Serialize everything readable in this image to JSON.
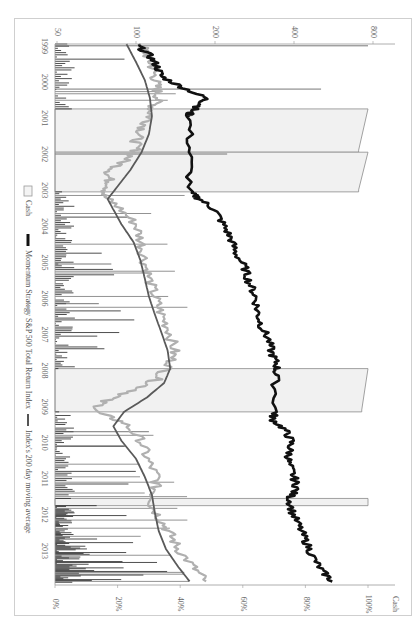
{
  "chart_data": {
    "type": "line",
    "orientation": "rotated-90-clockwise",
    "title": "",
    "xlabel": "",
    "ylabel_left": "",
    "ylabel_right": "Cash",
    "x_tick_labels": [
      "1999",
      "2000",
      "2001",
      "2002",
      "2003",
      "2004",
      "2005",
      "2006",
      "2007",
      "2008",
      "2009",
      "2010",
      "2011",
      "2012",
      "2013"
    ],
    "y_left_scale": "log",
    "y_left_ticks": [
      50,
      100,
      200,
      400,
      800
    ],
    "y_left_tick_labels": [
      "50",
      "100",
      "200",
      "400",
      "800"
    ],
    "y_right_ticks": [
      0,
      20,
      40,
      60,
      80,
      100
    ],
    "y_right_tick_labels": [
      "0%",
      "20%",
      "40%",
      "60%",
      "80%",
      "100%"
    ],
    "y_right_unit_label": "Cash",
    "legend": [
      {
        "name": "Cash",
        "style": "box-outline",
        "color": "#9a9a9a"
      },
      {
        "name": "Momentum Strategy",
        "style": "thick-line",
        "color": "#111111"
      },
      {
        "name": "S&P 500 Total Return Index",
        "style": "line",
        "color": "#b0b0b0"
      },
      {
        "name": "Index's 200 day moving average",
        "style": "line",
        "color": "#555555"
      }
    ],
    "legend_position": "left-side (rotated bottom)",
    "series": [
      {
        "name": "Momentum Strategy",
        "x": [
          1999.0,
          1999.3,
          1999.6,
          1999.9,
          2000.2,
          2000.5,
          2000.7,
          2000.9,
          2001.0,
          2002.0,
          2003.1,
          2003.3,
          2003.6,
          2004.0,
          2004.4,
          2004.8,
          2005.2,
          2005.6,
          2006.0,
          2006.4,
          2006.8,
          2007.2,
          2007.6,
          2007.9,
          2008.2,
          2009.2,
          2009.4,
          2009.7,
          2010.0,
          2010.3,
          2010.6,
          2011.0,
          2011.3,
          2011.6,
          2012.0,
          2012.4,
          2012.8,
          2013.2,
          2013.6,
          2013.9
        ],
        "values": [
          100,
          112,
          120,
          125,
          150,
          185,
          175,
          160,
          160,
          160,
          160,
          175,
          200,
          215,
          230,
          240,
          260,
          270,
          285,
          290,
          300,
          320,
          330,
          345,
          340,
          340,
          330,
          370,
          390,
          385,
          380,
          400,
          410,
          385,
          395,
          420,
          445,
          470,
          510,
          560
        ]
      },
      {
        "name": "S&P 500 Total Return Index",
        "x": [
          1999.0,
          1999.3,
          1999.6,
          1999.9,
          2000.2,
          2000.5,
          2000.8,
          2001.1,
          2001.4,
          2001.7,
          2002.0,
          2002.3,
          2002.6,
          2002.9,
          2003.2,
          2003.5,
          2004.0,
          2004.5,
          2005.0,
          2005.5,
          2006.0,
          2006.5,
          2007.0,
          2007.5,
          2007.9,
          2008.3,
          2008.6,
          2008.9,
          2009.2,
          2009.5,
          2010.0,
          2010.5,
          2011.0,
          2011.4,
          2011.8,
          2012.2,
          2012.6,
          2013.0,
          2013.5,
          2013.9
        ],
        "values": [
          105,
          110,
          115,
          118,
          120,
          122,
          115,
          112,
          105,
          100,
          100,
          88,
          78,
          80,
          75,
          85,
          100,
          105,
          108,
          112,
          118,
          125,
          135,
          140,
          135,
          120,
          100,
          75,
          70,
          90,
          105,
          110,
          120,
          118,
          115,
          125,
          135,
          145,
          165,
          185
        ]
      },
      {
        "name": "Index's 200 day moving average",
        "x": [
          1999.0,
          1999.5,
          2000.0,
          2000.5,
          2001.0,
          2001.5,
          2002.0,
          2002.5,
          2003.0,
          2003.3,
          2004.0,
          2004.5,
          2005.0,
          2005.5,
          2006.0,
          2006.5,
          2007.0,
          2007.5,
          2008.0,
          2008.4,
          2008.8,
          2009.2,
          2009.6,
          2010.0,
          2010.5,
          2011.0,
          2011.5,
          2012.0,
          2012.5,
          2013.0,
          2013.5,
          2013.9
        ],
        "values": [
          92,
          100,
          108,
          113,
          115,
          112,
          105,
          95,
          84,
          78,
          88,
          98,
          104,
          108,
          112,
          118,
          125,
          132,
          135,
          128,
          110,
          90,
          82,
          88,
          100,
          108,
          115,
          118,
          122,
          130,
          145,
          160
        ]
      },
      {
        "name": "Cash",
        "unit": "%",
        "x_periods": [
          {
            "start": 2000.8,
            "end": 2002.0,
            "cash_pct_start": 97,
            "cash_pct_end": 100
          },
          {
            "start": 2002.0,
            "end": 2003.1,
            "cash_pct_start": 97,
            "cash_pct_end": 100
          },
          {
            "start": 2008.0,
            "end": 2009.2,
            "cash_pct_start": 98,
            "cash_pct_end": 100
          },
          {
            "start": 2011.6,
            "end": 2011.8,
            "cash_pct_start": 100,
            "cash_pct_end": 100
          }
        ],
        "spikes_note": "Frequent short cash spikes of 5–45% in 1999–2000, 2003–2007, 2009–2011 and 2012–2013"
      }
    ],
    "grid": false
  }
}
